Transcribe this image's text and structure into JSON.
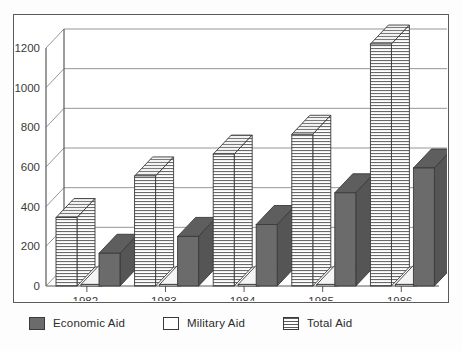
{
  "chart_data": {
    "type": "bar",
    "title": "",
    "subtitle": "",
    "xlabel": "",
    "ylabel": "",
    "categories": [
      "1982",
      "1983",
      "1984",
      "1985",
      "1986"
    ],
    "series": [
      {
        "name": "Economic Aid",
        "values": [
          165,
          250,
          310,
          470,
          595
        ],
        "color": "#6b6b6b",
        "fill": "solid-gray"
      },
      {
        "name": "Military Aid",
        "values": [
          8,
          8,
          8,
          8,
          8
        ],
        "color": "#ffffff",
        "fill": "white"
      },
      {
        "name": "Total Aid",
        "values": [
          345,
          555,
          665,
          765,
          1220
        ],
        "color": "#ffffff",
        "fill": "horizontal-hatch"
      }
    ],
    "ylim": [
      0,
      1200
    ],
    "yticks": [
      0,
      200,
      400,
      600,
      800,
      1000,
      1200
    ],
    "ytick_labels": [
      "0",
      "200",
      "400",
      "600",
      "800",
      "1000",
      "1200"
    ],
    "grid": true,
    "grid_axis": "y",
    "legend_position": "bottom",
    "style": "3d-isometric-bars"
  },
  "legend": {
    "entries": [
      {
        "label": "Economic Aid",
        "swatch": "solid-gray"
      },
      {
        "label": "Military Aid",
        "swatch": "white"
      },
      {
        "label": "Total Aid",
        "swatch": "horizontal-hatch"
      }
    ]
  },
  "caption": {
    "text": ""
  },
  "colors": {
    "economic": "#6b6b6b",
    "military": "#ffffff",
    "total_hatch": "#5a5a5a",
    "outline": "#3a3a3a",
    "frame": "#5a5a5a",
    "grid": "#8a8a8a"
  }
}
